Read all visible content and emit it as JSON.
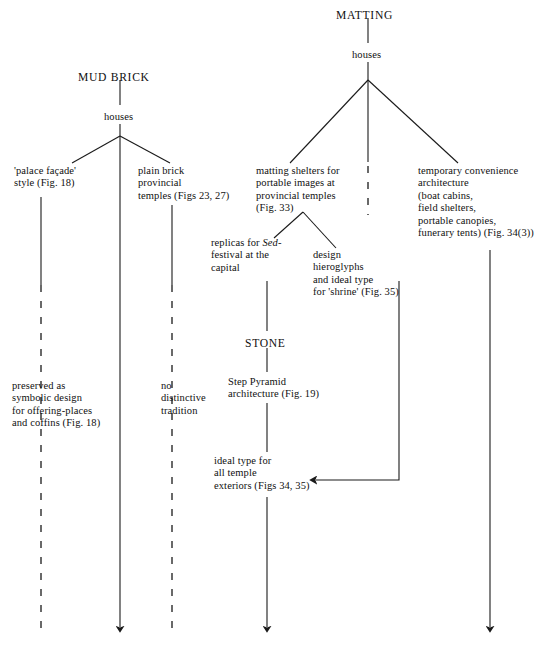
{
  "diagram": {
    "roots": [
      {
        "id": "mud-brick",
        "label": "MUD BRICK"
      },
      {
        "id": "matting",
        "label": "MATTING"
      },
      {
        "id": "stone",
        "label": "STONE"
      }
    ],
    "nodes": [
      {
        "id": "mud-brick-root",
        "name": "mud-brick-heading",
        "label": "MUD BRICK",
        "kind": "heading",
        "x": 78,
        "y": 72,
        "align": "left"
      },
      {
        "id": "mud-brick-houses",
        "name": "mud-brick-houses-node",
        "label": "houses",
        "kind": "node",
        "x": 104,
        "y": 111,
        "align": "left"
      },
      {
        "id": "palace-facade",
        "name": "palace-facade-node",
        "label": "'palace façade'\nstyle (Fig. 18)",
        "kind": "node",
        "x": 14,
        "y": 165,
        "align": "left"
      },
      {
        "id": "plain-brick",
        "name": "plain-brick-provincial-temples-node",
        "label": "plain brick\nprovincial\ntemples (Figs 23, 27)",
        "kind": "node",
        "x": 138,
        "y": 165,
        "align": "left"
      },
      {
        "id": "preserved-symbolic",
        "name": "preserved-symbolic-design-node",
        "label": "preserved as\nsymbolic design\nfor offering-places\nand coffins (Fig. 18)",
        "kind": "node",
        "x": 12,
        "y": 380,
        "align": "left"
      },
      {
        "id": "no-distinctive",
        "name": "no-distinctive-tradition-node",
        "label": "no\ndistinctive\ntradition",
        "kind": "node",
        "x": 161,
        "y": 380,
        "align": "left"
      },
      {
        "id": "matting-root",
        "name": "matting-heading",
        "label": "MATTING",
        "kind": "heading",
        "x": 336,
        "y": 10,
        "align": "left"
      },
      {
        "id": "matting-houses",
        "name": "matting-houses-node",
        "label": "houses",
        "kind": "node",
        "x": 352,
        "y": 49,
        "align": "left"
      },
      {
        "id": "matting-shelters",
        "name": "matting-shelters-node",
        "label": "matting shelters for\nportable images at\nprovincial temples\n(Fig. 33)",
        "kind": "node",
        "x": 256,
        "y": 165,
        "align": "left"
      },
      {
        "id": "temporary-convenience",
        "name": "temporary-convenience-architecture-node",
        "label": "temporary convenience\narchitecture\n(boat cabins,\nfield shelters,\nportable canopies,\nfunerary tents) (Fig. 34(3))",
        "kind": "node",
        "x": 418,
        "y": 165,
        "align": "left"
      },
      {
        "id": "replicas-sed",
        "name": "replicas-sed-festival-node",
        "label": "replicas for ",
        "label_italic": "Sed-",
        "label_rest": "\nfestival at the\ncapital",
        "kind": "node",
        "x": 211,
        "y": 237,
        "align": "left"
      },
      {
        "id": "design-hieroglyphs",
        "name": "design-hieroglyphs-node",
        "label": "design\nhieroglyphs\nand ideal type\nfor 'shrine' (Fig. 35)",
        "kind": "node",
        "x": 313,
        "y": 249,
        "align": "left"
      },
      {
        "id": "stone-root",
        "name": "stone-heading",
        "label": "STONE",
        "kind": "heading",
        "x": 245,
        "y": 338,
        "align": "left"
      },
      {
        "id": "step-pyramid",
        "name": "step-pyramid-architecture-node",
        "label": "Step Pyramid\narchitecture (Fig. 19)",
        "kind": "node",
        "x": 228,
        "y": 376,
        "align": "left"
      },
      {
        "id": "ideal-type-temple",
        "name": "ideal-type-temple-exteriors-node",
        "label": "ideal type for\nall temple\nexteriors (Figs 34, 35)",
        "kind": "node",
        "x": 214,
        "y": 455,
        "align": "left"
      }
    ],
    "edges": [
      {
        "name": "edge-mudbrick-to-houses",
        "kind": "solid-line",
        "points": "120,80 120,105"
      },
      {
        "name": "edge-houses-to-junction",
        "kind": "solid-line",
        "points": "120,124 120,136"
      },
      {
        "name": "edge-junction-to-palace-facade",
        "kind": "solid-line",
        "points": "120,136 72,163"
      },
      {
        "name": "edge-junction-to-plain-brick",
        "kind": "solid-line",
        "points": "120,136 170,163"
      },
      {
        "name": "edge-junction-to-centre",
        "kind": "solid-line",
        "points": "120,136 120,200"
      },
      {
        "name": "edge-palace-facade-stem",
        "kind": "solid-line",
        "points": "41,197 41,285"
      },
      {
        "name": "edge-palace-facade-dashed",
        "kind": "dashed-line",
        "points": "41,285 41,628"
      },
      {
        "name": "edge-mudbrick-centre-arrow",
        "kind": "solid-arrow",
        "points": "120,200 120,627"
      },
      {
        "name": "edge-plain-brick-stem",
        "kind": "solid-line",
        "points": "172,205 172,285"
      },
      {
        "name": "edge-plain-brick-dashed",
        "kind": "dashed-line",
        "points": "172,285 172,628"
      },
      {
        "name": "edge-matting-to-houses",
        "kind": "solid-line",
        "points": "368,18 368,43"
      },
      {
        "name": "edge-matting-houses-to-junction",
        "kind": "solid-line",
        "points": "368,62 368,80"
      },
      {
        "name": "edge-matting-junction-to-shelters",
        "kind": "solid-line",
        "points": "368,80 290,163"
      },
      {
        "name": "edge-matting-junction-to-temporary",
        "kind": "solid-line",
        "points": "368,80 458,163"
      },
      {
        "name": "edge-matting-junction-centre",
        "kind": "solid-line",
        "points": "368,80 368,162"
      },
      {
        "name": "edge-matting-centre-dashed",
        "kind": "dashed-line",
        "points": "368,166 368,215"
      },
      {
        "name": "edge-shelters-junction-to-replicas",
        "kind": "solid-line",
        "points": "303,212 274,238"
      },
      {
        "name": "edge-shelters-junction-to-design",
        "kind": "solid-line",
        "points": "303,212 336,248"
      },
      {
        "name": "edge-replicas-to-stone",
        "kind": "solid-line",
        "points": "267,281 267,331"
      },
      {
        "name": "edge-stone-to-steppyramid",
        "kind": "solid-line",
        "points": "267,348 267,372"
      },
      {
        "name": "edge-steppyramid-to-ideal",
        "kind": "solid-line",
        "points": "267,403 267,452"
      },
      {
        "name": "edge-ideal-type-arrow",
        "kind": "solid-arrow",
        "points": "267,497 267,627"
      },
      {
        "name": "edge-design-elbow-to-ideal",
        "kind": "solid-elbow-arrow",
        "points": "399,281 399,480 316,480"
      },
      {
        "name": "edge-temporary-arrow",
        "kind": "solid-arrow",
        "points": "490,250 490,627"
      }
    ],
    "style": {
      "line_color": "#1a1a1a",
      "text_color": "#101010",
      "background": "#ffffff"
    }
  }
}
